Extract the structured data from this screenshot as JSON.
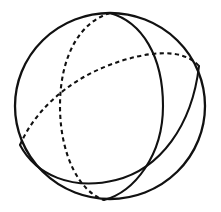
{
  "figure": {
    "background_color": "#ffffff",
    "stroke_color": "#111111",
    "line_width": 2.1,
    "dash_pattern": "4.2 3.4",
    "canvas": {
      "width": 221,
      "height": 212
    }
  },
  "sphere": {
    "name": "sphere-outline",
    "center": {
      "x": 110,
      "y": 106
    },
    "radius_x": 95,
    "radius_y": 93,
    "rotation_deg": 0,
    "visible": true
  },
  "great_circles": [
    {
      "id": "meridian",
      "name": "meridian-great-circle",
      "description": "near-vertical great circle through the top and bottom poles",
      "center": {
        "x": 110,
        "y": 106
      },
      "radius_major": 93,
      "radius_minor": 47,
      "rotation_deg": 8,
      "front_half_style": "solid",
      "back_half_style": "dashed",
      "pole_top": {
        "x": 110,
        "y": 13
      },
      "pole_bottom": {
        "x": 104,
        "y": 200
      }
    },
    {
      "id": "equator",
      "name": "equator-great-circle",
      "description": "tilted great circle rising from lower left to upper right",
      "center": {
        "x": 110,
        "y": 106
      },
      "radius_major": 95,
      "radius_minor": 40,
      "rotation_deg": -28,
      "front_half_style": "solid",
      "back_half_style": "dashed",
      "left_node": {
        "x": 20,
        "y": 145
      },
      "right_node": {
        "x": 199,
        "y": 66
      }
    }
  ],
  "intersections": [
    {
      "name": "crossing-upper-left",
      "x": 70,
      "y": 86
    },
    {
      "name": "crossing-lower-right",
      "x": 157,
      "y": 126
    },
    {
      "name": "crossing-lower-left",
      "x": 75,
      "y": 160
    },
    {
      "name": "crossing-upper-right",
      "x": 185,
      "y": 52
    }
  ]
}
